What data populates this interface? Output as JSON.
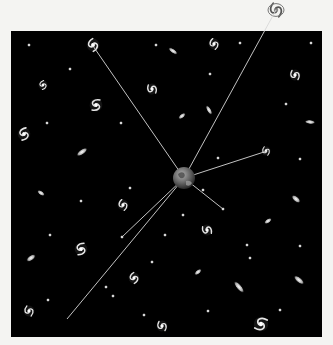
{
  "figure": {
    "background_color": "#f4f4f2",
    "space_color": "#000000",
    "frame": {
      "x": 11,
      "y": 31,
      "width": 311,
      "height": 306
    },
    "earth": {
      "x": 184,
      "y": 178,
      "r": 11,
      "color": "#6a6a6a"
    },
    "line_color": "#d8d8d8",
    "sight_lines": [
      {
        "to": [
          93,
          46
        ]
      },
      {
        "to": [
          276,
          10
        ]
      },
      {
        "to": [
          267,
          151
        ]
      },
      {
        "to": [
          223,
          209
        ]
      },
      {
        "to": [
          122,
          237
        ]
      },
      {
        "to": [
          67,
          319
        ]
      }
    ],
    "spirals": [
      {
        "x": 93,
        "y": 45,
        "s": 7,
        "rot": 20
      },
      {
        "x": 276,
        "y": 10,
        "s": 8,
        "rot": 0,
        "outside": true
      },
      {
        "x": 214,
        "y": 44,
        "s": 6,
        "rot": 10
      },
      {
        "x": 43,
        "y": 85,
        "s": 5,
        "rot": 30
      },
      {
        "x": 152,
        "y": 89,
        "s": 6,
        "rot": -20
      },
      {
        "x": 96,
        "y": 105,
        "s": 7,
        "rot": 60
      },
      {
        "x": 295,
        "y": 75,
        "s": 6,
        "rot": -10
      },
      {
        "x": 295,
        "y": 76,
        "s": 0,
        "rot": 0
      },
      {
        "x": 24,
        "y": 134,
        "s": 7,
        "rot": 40
      },
      {
        "x": 295,
        "y": 75,
        "s": 0,
        "rot": 0
      },
      {
        "x": 266,
        "y": 151,
        "s": 5,
        "rot": 0
      },
      {
        "x": 123,
        "y": 205,
        "s": 6,
        "rot": 10
      },
      {
        "x": 207,
        "y": 230,
        "s": 6,
        "rot": -30
      },
      {
        "x": 81,
        "y": 249,
        "s": 7,
        "rot": 50
      },
      {
        "x": 134,
        "y": 278,
        "s": 6,
        "rot": 20
      },
      {
        "x": 29,
        "y": 311,
        "s": 6,
        "rot": 0
      },
      {
        "x": 162,
        "y": 326,
        "s": 6,
        "rot": -10
      },
      {
        "x": 261,
        "y": 324,
        "s": 8,
        "rot": 80
      }
    ],
    "ellipticals": [
      {
        "x": 173,
        "y": 51,
        "rx": 5,
        "ry": 2,
        "rot": 35
      },
      {
        "x": 182,
        "y": 116,
        "rx": 4,
        "ry": 2,
        "rot": -40
      },
      {
        "x": 82,
        "y": 152,
        "rx": 6,
        "ry": 2.5,
        "rot": -35
      },
      {
        "x": 41,
        "y": 193,
        "rx": 4,
        "ry": 2,
        "rot": 35
      },
      {
        "x": 296,
        "y": 199,
        "rx": 5,
        "ry": 2.5,
        "rot": 40
      },
      {
        "x": 268,
        "y": 221,
        "rx": 4,
        "ry": 2,
        "rot": -35
      },
      {
        "x": 198,
        "y": 272,
        "rx": 4,
        "ry": 2,
        "rot": -40
      },
      {
        "x": 239,
        "y": 287,
        "rx": 7,
        "ry": 2.5,
        "rot": 50
      },
      {
        "x": 299,
        "y": 280,
        "rx": 6,
        "ry": 2.5,
        "rot": 40
      },
      {
        "x": 31,
        "y": 258,
        "rx": 5,
        "ry": 2.5,
        "rot": -35
      },
      {
        "x": 209,
        "y": 110,
        "rx": 5,
        "ry": 2,
        "rot": 60
      },
      {
        "x": 310,
        "y": 122,
        "rx": 5,
        "ry": 2,
        "rot": 5
      }
    ],
    "dots": [
      [
        29,
        45
      ],
      [
        156,
        45
      ],
      [
        240,
        43
      ],
      [
        311,
        43
      ],
      [
        70,
        69
      ],
      [
        210,
        74
      ],
      [
        47,
        123
      ],
      [
        121,
        123
      ],
      [
        286,
        104
      ],
      [
        130,
        188
      ],
      [
        218,
        158
      ],
      [
        300,
        159
      ],
      [
        81,
        201
      ],
      [
        203,
        190
      ],
      [
        183,
        215
      ],
      [
        223,
        209
      ],
      [
        122,
        237
      ],
      [
        48,
        300
      ],
      [
        152,
        262
      ],
      [
        165,
        235
      ],
      [
        50,
        235
      ],
      [
        247,
        245
      ],
      [
        113,
        296
      ],
      [
        144,
        315
      ],
      [
        208,
        311
      ],
      [
        250,
        258
      ],
      [
        280,
        310
      ],
      [
        300,
        246
      ],
      [
        106,
        287
      ]
    ]
  }
}
